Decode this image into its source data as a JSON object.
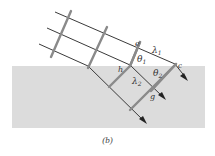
{
  "figure": {
    "caption": "(b)",
    "colors": {
      "background": "#ffffff",
      "medium": "#dcdcdc",
      "ray": "#3a3a3a",
      "wavefront": "#8a8a8a",
      "label": "#333333"
    },
    "labels": {
      "e": "e",
      "lambda1": "λ",
      "lambda1_sub": "1",
      "theta1": "θ",
      "theta1_sub": "1",
      "h": "h",
      "theta2": "θ",
      "theta2_sub": "2",
      "c": "c",
      "lambda2": "λ",
      "lambda2_sub": "2",
      "g": "g"
    },
    "elements": {
      "incident_rays": 3,
      "wavefronts_in_air": 3,
      "wavefronts_in_medium": 3,
      "medium_region": "refracting medium (gray)"
    }
  }
}
